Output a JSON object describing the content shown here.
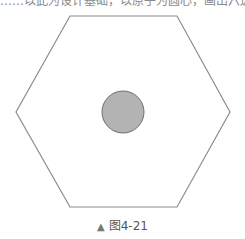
{
  "header": {
    "cut_text": "……以此为设计基础，以原子为圆心，画出六边形……"
  },
  "figure": {
    "shape": "hexagon",
    "hexagon_stroke": "#888888",
    "circle_fill": "#b0b0b0",
    "circle_stroke": "#777777"
  },
  "caption": {
    "marker": "▲",
    "label": "图4-21"
  }
}
